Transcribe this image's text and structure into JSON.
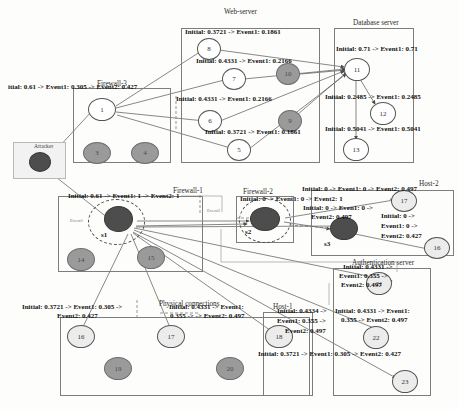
{
  "figure": {
    "caption": ""
  },
  "attacker": {
    "label": "Attacker"
  },
  "zones": [
    {
      "id": "firewall3",
      "title": "Firewall-3"
    },
    {
      "id": "webserver",
      "title": "Web-server"
    },
    {
      "id": "database",
      "title": "Database server"
    },
    {
      "id": "firewall1",
      "title": "Firewall-1"
    },
    {
      "id": "firewall2",
      "title": "Firewall-2"
    },
    {
      "id": "host2",
      "title": "Host-2"
    },
    {
      "id": "authserver",
      "title": "Authentication server"
    },
    {
      "id": "physical",
      "title": "Physical connections"
    },
    {
      "id": "host1",
      "title": "Host-1"
    }
  ],
  "nodes": [
    {
      "id": "attacker",
      "label": "",
      "style": "dark"
    },
    {
      "id": "n1",
      "label": "1",
      "style": "white"
    },
    {
      "id": "n3",
      "label": "3",
      "style": "gray"
    },
    {
      "id": "n4",
      "label": "4",
      "style": "gray"
    },
    {
      "id": "n8",
      "label": "8",
      "style": "white"
    },
    {
      "id": "n7",
      "label": "7",
      "style": "white"
    },
    {
      "id": "n10",
      "label": "10",
      "style": "gray"
    },
    {
      "id": "n6",
      "label": "6",
      "style": "white"
    },
    {
      "id": "n9",
      "label": "9",
      "style": "gray"
    },
    {
      "id": "n5",
      "label": "5",
      "style": "white"
    },
    {
      "id": "n11",
      "label": "11",
      "style": "white"
    },
    {
      "id": "n12",
      "label": "12",
      "style": "white"
    },
    {
      "id": "n13",
      "label": "13",
      "style": "white"
    },
    {
      "id": "n2",
      "label": "2",
      "style": "dark",
      "selector": "s1"
    },
    {
      "id": "n14",
      "label": "14",
      "style": "gray"
    },
    {
      "id": "n15",
      "label": "15",
      "style": "gray"
    },
    {
      "id": "ns2",
      "label": "2-Inv",
      "style": "dark",
      "selector": "s2"
    },
    {
      "id": "ns3",
      "label": "4",
      "style": "dark",
      "selector": "s3"
    },
    {
      "id": "n17b",
      "label": "17",
      "style": "pale"
    },
    {
      "id": "n16b",
      "label": "16",
      "style": "pale"
    },
    {
      "id": "n21",
      "label": "21",
      "style": "pale"
    },
    {
      "id": "n22",
      "label": "22",
      "style": "pale"
    },
    {
      "id": "n23",
      "label": "23",
      "style": "pale"
    },
    {
      "id": "n16",
      "label": "16",
      "style": "pale"
    },
    {
      "id": "n17",
      "label": "17",
      "style": "pale"
    },
    {
      "id": "n19",
      "label": "19",
      "style": "gray"
    },
    {
      "id": "n20",
      "label": "20",
      "style": "gray"
    },
    {
      "id": "n18",
      "label": "18",
      "style": "pale"
    }
  ],
  "labels": {
    "node1": "itial: 0.61 -> Event1: 0.305 -> Event2: 0.427",
    "node8": "Initial: 0.3721 -> Event1: 0.1861",
    "node7": "Initial: 0.4331 -> Event1: 0.2166",
    "node6": "Initial: 0.4331 -> Event1: 0.2166",
    "node5": "Initial: 0.3721 -> Event1: 0.1861",
    "node11": "Initial: 0.71 -> Event1: 0.71",
    "node12": "Initial: 0.2485 -> Event1: 0.2485",
    "node13": "Initial: 0.5041 -> Event1: 0.5041",
    "node2": "Initial: 0.61 -> Event1: 1 -> Event2: 1",
    "nodes2": "Initial: 0 -> Event1: 0 -> Event2: 1",
    "nodes3a": "Initial: 0 -> Even1: 0 ->",
    "nodes3b": "Event2: 0.497",
    "node17b": "Initial: 0 -> Event1: 0 -> Event2: 0.497",
    "node16b_l1": "Initial: 0 ->",
    "node16b_l2": "Event1: 0 ->",
    "node16b_l3": "Event2: 0.427",
    "node21_l1": "Initial: 0.4331 ->",
    "node21_l2": "Event1: 0.355  ->",
    "node21_l3": "Event2: 0.497",
    "node22_l1": "Initial: 0.4331 -> Event1:",
    "node22_l2": "0.355 -> Event2: 0.497",
    "node23": "Initial: 0.3721 -> Event1: 0.305 -> Event2: 0.427",
    "node16_l1": "Initial: 0.3721 -> Event1: 0.305 ->",
    "node16_l2": "Event2: 0.427",
    "node17_l1": "Initial: 0.4331 -> Event1:",
    "node17_l2": "0.355 -> -> Event2: 0.497",
    "node18_l1": "Initial: 0.4334 ->",
    "node18_l2": "Event1: 0.355 ->",
    "node18_l3": "Event2: 0.497"
  },
  "edge_tags": {
    "event1": "Event1",
    "event2": "Event2"
  },
  "colors": {
    "node_dark": "#4d4d4d",
    "node_gray": "#9a9a9a",
    "node_pale": "#ececec",
    "node_white": "#ffffff",
    "zone_border": "#7d7d7d",
    "edge": "#555555",
    "text": "#111111"
  }
}
